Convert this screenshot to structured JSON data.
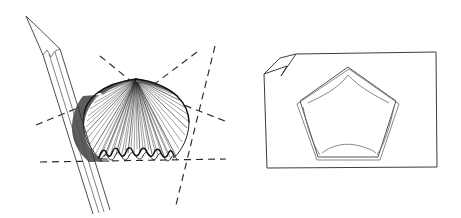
{
  "figure": {
    "background_color": "#ffffff",
    "ink_color": "#1c1c1c",
    "shade_color": "#5d5d5d",
    "width": 461,
    "height": 218,
    "panel_count": 2
  },
  "panels": [
    {
      "id": "left-panel",
      "name": "pencil-fan-construction",
      "caption": "",
      "elements": {
        "pencil": {
          "name": "pencil",
          "tip_point": [
            26,
            16
          ],
          "body_angle_deg": 62,
          "shaft_line_count": 5,
          "color": "#2e2e2e"
        },
        "fan": {
          "name": "fan-shell",
          "apex": [
            136,
            79
          ],
          "ray_count": 46,
          "radius": 88,
          "start_angle_deg": 182,
          "end_angle_deg": 358,
          "wavy_edge": true,
          "wave_count": 9,
          "shadow_side": "left",
          "shadow_color": "#5d5d5d"
        },
        "dashed_construction_lines": [
          {
            "name": "dash-line-upper-left",
            "from": [
              100,
              56
            ],
            "to": [
              180,
              120
            ]
          },
          {
            "name": "dash-line-upper-right",
            "from": [
              196,
              52
            ],
            "to": [
              118,
              113
            ]
          },
          {
            "name": "dash-line-horizontal",
            "from": [
              40,
              162
            ],
            "to": [
              226,
              158
            ]
          },
          {
            "name": "dash-line-left-diagonal",
            "from": [
              36,
              124
            ],
            "to": [
              132,
              84
            ]
          },
          {
            "name": "dash-line-right-steep",
            "from": [
              214,
              46
            ],
            "to": [
              176,
              204
            ]
          },
          {
            "name": "dash-line-right-lower",
            "from": [
              138,
              88
            ],
            "to": [
              224,
              120
            ]
          }
        ]
      }
    },
    {
      "id": "right-panel",
      "name": "card-with-pentagon",
      "caption": "",
      "elements": {
        "card": {
          "name": "paper-card",
          "left": 264,
          "top": 52,
          "right": 437,
          "bottom": 168,
          "corner_fold": "top-left",
          "stroke_color": "#3d3d3d"
        },
        "pentagon": {
          "name": "pentagon-outline",
          "center": [
            348,
            114
          ],
          "vertex_count": 5,
          "circumradius": 48,
          "rotation_deg": -90,
          "double_stroked": true,
          "inner_arc_count": 5,
          "stroke_color": "#4a4a4a"
        }
      }
    }
  ]
}
